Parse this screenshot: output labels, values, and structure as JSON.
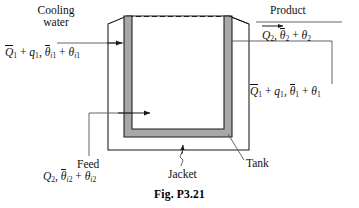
{
  "figure": {
    "caption": "Fig. P3.21",
    "type": "jacketed-stirred-tank-process-schematic"
  },
  "labels": {
    "cooling_water": "Cooling water",
    "cooling_water_line1": "Cooling",
    "cooling_water_line2": "water",
    "product": "Product",
    "feed": "Feed",
    "jacket": "Jacket",
    "tank": "Tank"
  },
  "streams": {
    "cooling_water_inlet": {
      "name": "Cooling water inlet",
      "flow_symbol": "Q",
      "flow_mean_subscript": "1",
      "flow_deviation_symbol": "q",
      "flow_deviation_subscript": "1",
      "temp_symbol": "θ",
      "temp_mean_subscript": "i1",
      "temp_deviation_subscript": "i1",
      "text": "Q̅1 + q1, θ̅i1 + θi1"
    },
    "cooling_water_outlet": {
      "name": "Cooling water outlet",
      "flow_symbol": "Q",
      "flow_mean_subscript": "1",
      "flow_deviation_symbol": "q",
      "flow_deviation_subscript": "1",
      "temp_symbol": "θ",
      "temp_mean_subscript": "1",
      "temp_deviation_subscript": "1",
      "text": "Q̅1 + q1, θ̅1 + θ1"
    },
    "product": {
      "name": "Product stream",
      "flow_symbol": "Q",
      "flow_subscript": "2",
      "temp_symbol": "θ",
      "temp_mean_subscript": "2",
      "temp_deviation_subscript": "2",
      "text": "Q2, θ̅2 + θ2"
    },
    "feed": {
      "name": "Feed stream",
      "flow_symbol": "Q",
      "flow_subscript": "2",
      "temp_symbol": "θ",
      "temp_mean_subscript": "i2",
      "temp_deviation_subscript": "i2",
      "text": "Q2, θ̅i2 + θi2"
    }
  },
  "colors": {
    "line": "#1a1a1a",
    "leader": "#555555",
    "jacket_fill": "#a8a8a8",
    "background": "#ffffff"
  }
}
